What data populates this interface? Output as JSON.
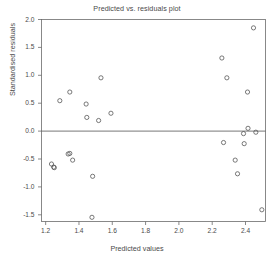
{
  "chart_data": {
    "type": "scatter",
    "title": "Predicted vs. residuals plot",
    "xlabel": "Predicted values",
    "ylabel": "Standardised residuals",
    "xlim": [
      1.175,
      2.52
    ],
    "ylim": [
      -1.62,
      2.0
    ],
    "xticks": [
      1.2,
      1.4,
      1.6,
      1.8,
      2.0,
      2.2,
      2.4
    ],
    "xtick_labels": [
      "1.2",
      "1.4",
      "1.6",
      "1.8",
      "2.0",
      "2.2",
      "2.4"
    ],
    "yticks": [
      -1.5,
      -1.0,
      -0.5,
      0.0,
      0.5,
      1.0,
      1.5,
      2.0
    ],
    "ytick_labels": [
      "-1.5",
      "-1.0",
      "-0.5",
      "0.0",
      "0.5",
      "1.0",
      "1.5",
      "2.0"
    ],
    "grid": false,
    "legend": null,
    "reference_lines": [
      {
        "orientation": "horizontal",
        "value": 0.0,
        "color": "#555555"
      }
    ],
    "marker": {
      "shape": "open-circle",
      "radius": 2.1,
      "stroke": "#4d4d4d",
      "fill": "none"
    },
    "series": [
      {
        "name": "residuals",
        "points": [
          {
            "x": 1.235,
            "y": -0.59
          },
          {
            "x": 1.248,
            "y": -0.645
          },
          {
            "x": 1.252,
            "y": -0.655
          },
          {
            "x": 1.285,
            "y": 0.545
          },
          {
            "x": 1.335,
            "y": -0.41
          },
          {
            "x": 1.345,
            "y": -0.4
          },
          {
            "x": 1.345,
            "y": 0.7
          },
          {
            "x": 1.362,
            "y": -0.52
          },
          {
            "x": 1.443,
            "y": 0.485
          },
          {
            "x": 1.447,
            "y": 0.245
          },
          {
            "x": 1.478,
            "y": -1.545
          },
          {
            "x": 1.482,
            "y": -0.81
          },
          {
            "x": 1.518,
            "y": 0.19
          },
          {
            "x": 1.532,
            "y": 0.955
          },
          {
            "x": 1.592,
            "y": 0.32
          },
          {
            "x": 2.258,
            "y": 1.31
          },
          {
            "x": 2.268,
            "y": -0.205
          },
          {
            "x": 2.288,
            "y": 0.955
          },
          {
            "x": 2.338,
            "y": -0.52
          },
          {
            "x": 2.352,
            "y": -0.765
          },
          {
            "x": 2.388,
            "y": -0.045
          },
          {
            "x": 2.392,
            "y": -0.225
          },
          {
            "x": 2.412,
            "y": 0.7
          },
          {
            "x": 2.415,
            "y": 0.05
          },
          {
            "x": 2.448,
            "y": 1.85
          },
          {
            "x": 2.462,
            "y": -0.02
          },
          {
            "x": 2.498,
            "y": -1.41
          }
        ]
      }
    ]
  }
}
